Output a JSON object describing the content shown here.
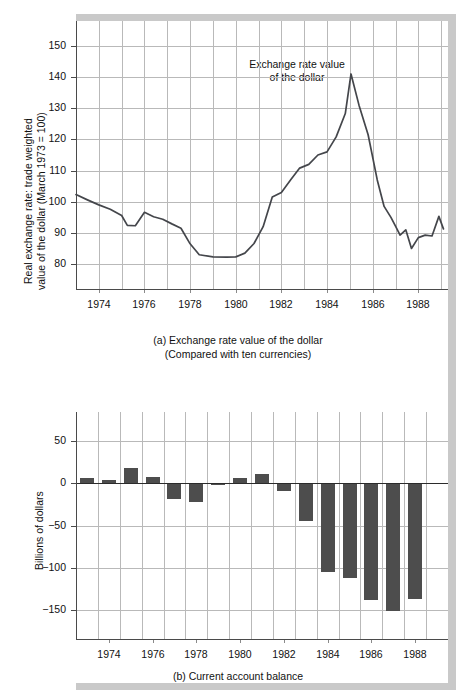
{
  "figure": {
    "caption_a_line1": "(a) Exchange rate value of the dollar",
    "caption_a_line2": "(Compared with ten currencies)",
    "caption_b": "(b) Current account balance"
  },
  "chart_data": [
    {
      "id": "exchange-rate",
      "type": "line",
      "title": "",
      "annotation_line1": "Exchange rate value",
      "annotation_line2": "of the dollar",
      "xlabel": "",
      "ylabel": "Real exchange rate: trade weighted value of the dollar (March 1973 = 100)",
      "ylabel_line1": "Real exchange rate: trade weighted",
      "ylabel_line2": "value of the dollar (March 1973 = 100)",
      "yticks": [
        80,
        90,
        100,
        110,
        120,
        130,
        140,
        150
      ],
      "ytick_labels": [
        "80",
        "90",
        "100",
        "110",
        "120",
        "130",
        "140",
        "150"
      ],
      "ylim": [
        72,
        158
      ],
      "xticks": [
        1974,
        1976,
        1978,
        1980,
        1982,
        1984,
        1986,
        1988
      ],
      "xtick_labels": [
        "1974",
        "1976",
        "1978",
        "1980",
        "1982",
        "1984",
        "1986",
        "1988"
      ],
      "xlim": [
        1973.0,
        1989.3
      ],
      "grid": true,
      "line_color": "#44464b",
      "x": [
        1973.0,
        1973.5,
        1974.0,
        1974.5,
        1975.0,
        1975.25,
        1975.6,
        1976.0,
        1976.4,
        1976.8,
        1977.2,
        1977.6,
        1978.0,
        1978.4,
        1979.0,
        1979.6,
        1980.0,
        1980.4,
        1980.8,
        1981.2,
        1981.6,
        1982.0,
        1982.4,
        1982.8,
        1983.2,
        1983.6,
        1984.0,
        1984.4,
        1984.8,
        1985.05,
        1985.4,
        1985.8,
        1986.2,
        1986.5,
        1986.8,
        1987.0,
        1987.2,
        1987.45,
        1987.7,
        1988.0,
        1988.3,
        1988.6,
        1988.9,
        1989.1
      ],
      "y": [
        102.3,
        100.6,
        99.0,
        97.6,
        95.6,
        92.4,
        92.3,
        96.6,
        95.2,
        94.4,
        92.9,
        91.5,
        86.5,
        83.0,
        82.3,
        82.2,
        82.3,
        83.5,
        86.6,
        92.0,
        101.5,
        103.0,
        107.0,
        110.8,
        112.0,
        115.0,
        116.0,
        120.8,
        128.3,
        141.0,
        131.0,
        121.5,
        107.0,
        98.5,
        95.0,
        92.2,
        89.3,
        91.0,
        85.0,
        88.5,
        89.3,
        89.0,
        95.3,
        91.3
      ]
    },
    {
      "id": "current-account-balance",
      "type": "bar",
      "title": "",
      "xlabel": "",
      "ylabel": "Billions of dollars",
      "yticks": [
        50,
        0,
        -50,
        -100,
        -150
      ],
      "ytick_labels": [
        "50",
        "0",
        "−50",
        "−100",
        "−150"
      ],
      "ylim": [
        -185,
        85
      ],
      "xticks": [
        1974,
        1976,
        1978,
        1980,
        1982,
        1984,
        1986,
        1988
      ],
      "xtick_labels": [
        "1974",
        "1976",
        "1978",
        "1980",
        "1982",
        "1984",
        "1986",
        "1988"
      ],
      "grid": true,
      "bar_color": "#4d4d4d",
      "categories": [
        1973,
        1974,
        1975,
        1976,
        1977,
        1978,
        1979,
        1980,
        1981,
        1982,
        1983,
        1984,
        1985,
        1986,
        1987,
        1988
      ],
      "values": [
        7,
        4,
        18,
        8,
        -18,
        -22,
        -2,
        6,
        11,
        -9,
        -45,
        -105,
        -113,
        -139,
        -152,
        -137
      ]
    }
  ]
}
